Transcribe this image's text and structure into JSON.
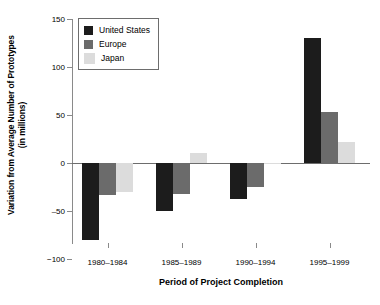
{
  "chart_data": {
    "type": "bar",
    "title": "",
    "xlabel": "Period of Project Completion",
    "ylabel": "Variation from Average Number of Prototypes (in millions)",
    "ylabel_line1": "Variation from Average Number of Prototypes",
    "ylabel_line2": "(in millions)",
    "categories": [
      "1980–1984",
      "1985–1989",
      "1990–1994",
      "1995–1999"
    ],
    "series": [
      {
        "name": "United States",
        "color": "#1c1c1c",
        "values": [
          -80,
          -50,
          -38,
          130
        ]
      },
      {
        "name": "Europe",
        "color": "#6b6b6b",
        "values": [
          -33,
          -32,
          -25,
          53
        ]
      },
      {
        "name": "Japan",
        "color": "#dcdcdc",
        "values": [
          -30,
          10,
          -1,
          22
        ]
      }
    ],
    "ylim": [
      -100,
      150
    ],
    "yticks": [
      150,
      100,
      50,
      0,
      -50,
      -100
    ],
    "ytick_labels": [
      "150",
      "100",
      "50",
      "0",
      "‒50",
      "−100"
    ],
    "grid": false,
    "legend_position": "top-left",
    "axis_color": "#8a8a8a"
  },
  "legend": {
    "items": [
      {
        "label": "United States",
        "color": "#1c1c1c"
      },
      {
        "label": "Europe",
        "color": "#6b6b6b"
      },
      {
        "label": "Japan",
        "color": "#dcdcdc"
      }
    ]
  }
}
